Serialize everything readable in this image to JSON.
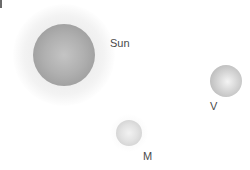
{
  "diagram": {
    "bodies": [
      {
        "id": "sun",
        "label": "Sun"
      },
      {
        "id": "venus",
        "label": "V"
      },
      {
        "id": "mercury",
        "label": "M"
      }
    ]
  }
}
